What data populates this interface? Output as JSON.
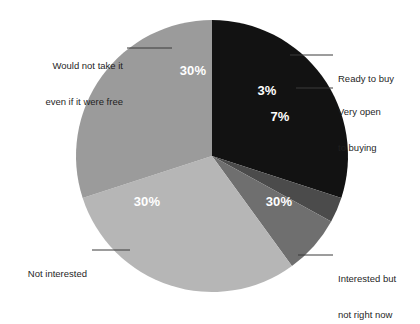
{
  "chart_data": {
    "type": "pie",
    "title": "",
    "subtitle": "",
    "xlabel": "",
    "ylabel": "",
    "legend_position": "callout-labels",
    "grid": false,
    "total": 100,
    "units": "%",
    "categories": [
      "Would not take it even if it were free",
      "Ready to buy",
      "Very open to buying",
      "Interested but not right now",
      "Not interested"
    ],
    "values": [
      30,
      3,
      7,
      30,
      30
    ],
    "slices": [
      {
        "key": "would-not-take-it",
        "label_line1": "Would not take it",
        "label_line2": "even if it were free",
        "value": 30,
        "value_label": "30%",
        "color": "#121212"
      },
      {
        "key": "ready-to-buy",
        "label_line1": "Ready to buy",
        "label_line2": "",
        "value": 3,
        "value_label": "3%",
        "color": "#4b4b4b"
      },
      {
        "key": "very-open-to-buying",
        "label_line1": "Very open",
        "label_line2": "to buying",
        "value": 7,
        "value_label": "7%",
        "color": "#6f6f6f"
      },
      {
        "key": "interested-but-not-right-now",
        "label_line1": "Interested but",
        "label_line2": "not right now",
        "value": 30,
        "value_label": "30%",
        "color": "#b6b6b6"
      },
      {
        "key": "not-interested",
        "label_line1": "Not interested",
        "label_line2": "",
        "value": 30,
        "value_label": "30%",
        "color": "#9b9b9b"
      }
    ],
    "background_color": "#ffffff",
    "value_label_color": "#ffffff",
    "category_label_color": "#1f1f1f",
    "leader_line_color": "#3a3a3a"
  }
}
